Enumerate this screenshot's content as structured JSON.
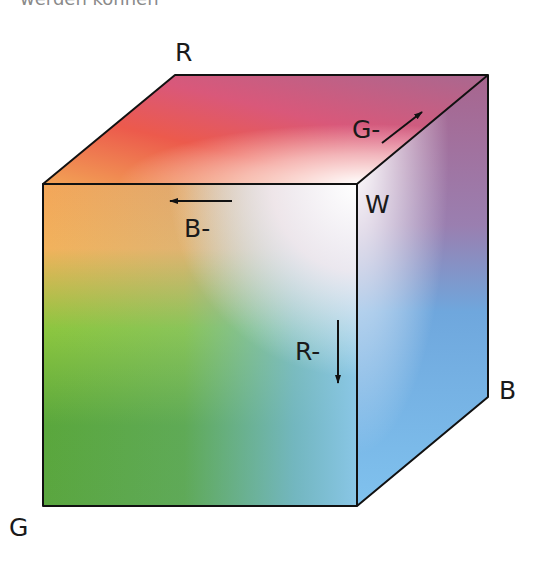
{
  "caption": {
    "cutoff_text": "werden können"
  },
  "diagram": {
    "corner_labels": {
      "red": "R",
      "green": "G",
      "blue": "B",
      "white": "W"
    },
    "arrow_labels": {
      "blue_minus": "B-",
      "red_minus": "R-",
      "green_minus": "G-"
    },
    "colors": {
      "red": "#ea4a4a",
      "orange": "#f1a24a",
      "green": "#5aa838",
      "light_green": "#8cc63e",
      "blue": "#7bbcea",
      "magenta": "#b06a8e",
      "white": "#ffffff",
      "edge": "#111111"
    }
  }
}
